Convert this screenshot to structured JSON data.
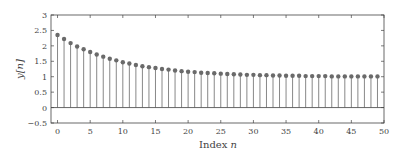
{
  "chart_data": {
    "type": "stem",
    "title": "",
    "xlabel": "Index",
    "xlabel_var": "n",
    "ylabel": "y[n]",
    "xlim": [
      -1,
      50
    ],
    "ylim": [
      -0.5,
      3
    ],
    "grid": false,
    "legend": null,
    "x_ticks": [
      0,
      5,
      10,
      15,
      20,
      25,
      30,
      35,
      40,
      45,
      50
    ],
    "y_ticks": [
      -0.5,
      0,
      0.5,
      1,
      1.5,
      2,
      2.5,
      3
    ],
    "y_tick_labels": [
      "−0.5",
      "0",
      "0.5",
      "1",
      "1.5",
      "2",
      "2.5",
      "3"
    ],
    "x_tick_labels": [
      "0",
      "5",
      "10",
      "15",
      "20",
      "25",
      "30",
      "35",
      "40",
      "45",
      "50"
    ],
    "baseline": 0,
    "series": [
      {
        "name": "y[n]",
        "x": [
          0,
          1,
          2,
          3,
          4,
          5,
          6,
          7,
          8,
          9,
          10,
          11,
          12,
          13,
          14,
          15,
          16,
          17,
          18,
          19,
          20,
          21,
          22,
          23,
          24,
          25,
          26,
          27,
          28,
          29,
          30,
          31,
          32,
          33,
          34,
          35,
          36,
          37,
          38,
          39,
          40,
          41,
          42,
          43,
          44,
          45,
          46,
          47,
          48,
          49
        ],
        "values": [
          2.35,
          2.22,
          2.09,
          1.98,
          1.89,
          1.8,
          1.72,
          1.65,
          1.58,
          1.53,
          1.47,
          1.43,
          1.38,
          1.34,
          1.31,
          1.28,
          1.25,
          1.23,
          1.2,
          1.18,
          1.16,
          1.15,
          1.13,
          1.12,
          1.11,
          1.1,
          1.09,
          1.08,
          1.07,
          1.06,
          1.06,
          1.05,
          1.05,
          1.04,
          1.04,
          1.03,
          1.03,
          1.03,
          1.02,
          1.02,
          1.02,
          1.02,
          1.01,
          1.01,
          1.01,
          1.01,
          1.01,
          1.01,
          1.01,
          1.01
        ]
      }
    ],
    "colors": {
      "stem": "#7a7a7a",
      "marker": "#6a6a6a",
      "baseline": "#555555",
      "frame": "#444444",
      "text": "#444444"
    }
  },
  "layout": {
    "plot_left": 51,
    "plot_right": 384,
    "plot_top": 15,
    "plot_bottom": 123
  }
}
